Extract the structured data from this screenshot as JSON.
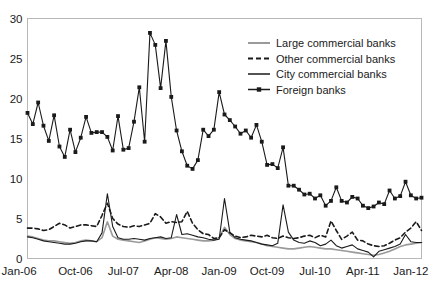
{
  "chart_data": {
    "type": "line",
    "title": "",
    "subtitle": "",
    "xlabel": "",
    "ylabel": "",
    "ylim": [
      0,
      30
    ],
    "yticks": [
      0,
      5,
      10,
      15,
      20,
      25,
      30
    ],
    "ytick_labels": [
      "0",
      "5",
      "10",
      "15",
      "20",
      "25",
      "30"
    ],
    "grid": false,
    "legend_position": "top-right",
    "x_start": "Jan-06",
    "x_end": "Mar-12",
    "x_interval": "monthly",
    "xtick_labels": [
      "Jan-06",
      "Oct-06",
      "Jul-07",
      "Apr-08",
      "Jan-09",
      "Oct-09",
      "Jul-10",
      "Apr-11",
      "Jan-12"
    ],
    "xtick_indices": [
      0,
      9,
      18,
      27,
      36,
      45,
      54,
      63,
      72
    ],
    "x": [
      "Jan-06",
      "Feb-06",
      "Mar-06",
      "Apr-06",
      "May-06",
      "Jun-06",
      "Jul-06",
      "Aug-06",
      "Sep-06",
      "Oct-06",
      "Nov-06",
      "Dec-06",
      "Jan-07",
      "Feb-07",
      "Mar-07",
      "Apr-07",
      "May-07",
      "Jun-07",
      "Jul-07",
      "Aug-07",
      "Sep-07",
      "Oct-07",
      "Nov-07",
      "Dec-07",
      "Jan-08",
      "Feb-08",
      "Mar-08",
      "Apr-08",
      "May-08",
      "Jun-08",
      "Jul-08",
      "Aug-08",
      "Sep-08",
      "Oct-08",
      "Nov-08",
      "Dec-08",
      "Jan-09",
      "Feb-09",
      "Mar-09",
      "Apr-09",
      "May-09",
      "Jun-09",
      "Jul-09",
      "Aug-09",
      "Sep-09",
      "Oct-09",
      "Nov-09",
      "Dec-09",
      "Jan-10",
      "Feb-10",
      "Mar-10",
      "Apr-10",
      "May-10",
      "Jun-10",
      "Jul-10",
      "Aug-10",
      "Sep-10",
      "Oct-10",
      "Nov-10",
      "Dec-10",
      "Jan-11",
      "Feb-11",
      "Mar-11",
      "Apr-11",
      "May-11",
      "Jun-11",
      "Jul-11",
      "Aug-11",
      "Sep-11",
      "Oct-11",
      "Nov-11",
      "Dec-11",
      "Jan-12",
      "Feb-12",
      "Mar-12"
    ],
    "series": [
      {
        "name": "Large commercial banks",
        "style": "solid",
        "color": "#9a9a9a",
        "width": 1.6,
        "marker": "none",
        "values": [
          2.8,
          2.7,
          2.5,
          2.3,
          2.2,
          2.2,
          2.1,
          2.0,
          1.9,
          2.0,
          2.2,
          2.3,
          2.2,
          2.1,
          2.6,
          4.6,
          2.8,
          2.4,
          2.3,
          2.2,
          2.1,
          2.0,
          2.2,
          2.4,
          2.6,
          2.5,
          2.4,
          2.5,
          2.7,
          2.6,
          2.5,
          2.4,
          2.3,
          2.2,
          2.2,
          2.3,
          2.6,
          3.9,
          3.0,
          2.5,
          2.3,
          2.2,
          2.1,
          2.0,
          1.8,
          1.6,
          1.5,
          1.4,
          1.3,
          1.2,
          1.2,
          1.3,
          1.4,
          1.5,
          1.4,
          1.3,
          1.2,
          1.2,
          1.1,
          1.0,
          0.9,
          0.8,
          0.7,
          0.6,
          0.5,
          0.4,
          0.5,
          0.7,
          0.9,
          1.2,
          1.5,
          1.7,
          1.8,
          1.9,
          2.0
        ]
      },
      {
        "name": "Other commercial banks",
        "style": "dashed",
        "color": "#1a1a1a",
        "width": 1.6,
        "marker": "none",
        "values": [
          3.8,
          3.8,
          3.7,
          3.5,
          3.6,
          4.0,
          4.4,
          4.2,
          3.8,
          4.0,
          4.2,
          4.2,
          4.1,
          4.0,
          5.4,
          6.9,
          5.0,
          4.3,
          4.0,
          3.9,
          4.1,
          4.0,
          4.2,
          4.4,
          5.6,
          5.2,
          4.4,
          4.6,
          4.5,
          4.6,
          5.9,
          4.4,
          3.6,
          3.1,
          3.0,
          2.5,
          2.6,
          3.6,
          3.2,
          2.8,
          2.6,
          2.7,
          2.9,
          2.8,
          2.7,
          2.9,
          2.6,
          2.5,
          2.8,
          2.6,
          2.5,
          2.6,
          2.8,
          2.9,
          2.6,
          2.9,
          2.7,
          4.7,
          3.5,
          2.4,
          2.8,
          3.3,
          2.3,
          2.2,
          1.8,
          1.6,
          1.5,
          1.6,
          1.9,
          2.3,
          2.6,
          3.3,
          3.8,
          4.6,
          3.5
        ]
      },
      {
        "name": "City commercial banks",
        "style": "solid",
        "color": "#1a1a1a",
        "width": 1.1,
        "marker": "none",
        "values": [
          2.7,
          2.6,
          2.4,
          2.2,
          2.1,
          2.0,
          1.9,
          1.8,
          1.8,
          1.9,
          2.1,
          2.2,
          2.2,
          2.1,
          3.2,
          8.1,
          4.0,
          2.6,
          2.4,
          2.4,
          2.5,
          2.4,
          2.3,
          2.5,
          2.6,
          2.7,
          2.5,
          2.6,
          5.5,
          3.0,
          3.1,
          2.9,
          2.7,
          2.6,
          2.4,
          2.3,
          2.4,
          7.5,
          3.3,
          2.6,
          2.4,
          2.3,
          2.2,
          2.0,
          1.8,
          1.7,
          1.6,
          1.9,
          6.7,
          3.3,
          2.3,
          2.0,
          1.9,
          2.2,
          2.0,
          1.6,
          1.8,
          2.3,
          1.6,
          1.3,
          1.5,
          1.7,
          1.2,
          1.0,
          0.8,
          0.2,
          0.9,
          1.1,
          1.3,
          1.5,
          1.8,
          3.0,
          2.1,
          2.0,
          2.0
        ]
      },
      {
        "name": "Foreign banks",
        "style": "solid",
        "color": "#1a1a1a",
        "width": 1.1,
        "marker": "square",
        "values": [
          18.2,
          16.8,
          19.5,
          16.6,
          14.7,
          17.9,
          14.0,
          12.7,
          16.1,
          13.3,
          15.1,
          17.7,
          15.7,
          15.8,
          15.8,
          15.2,
          13.5,
          17.8,
          13.6,
          13.8,
          17.1,
          21.4,
          14.6,
          28.2,
          26.7,
          21.3,
          27.2,
          20.2,
          16.0,
          13.4,
          11.6,
          11.2,
          12.3,
          16.1,
          15.3,
          16.1,
          20.8,
          18.0,
          17.3,
          16.5,
          15.6,
          16.0,
          15.1,
          16.7,
          14.6,
          11.7,
          11.8,
          11.3,
          13.9,
          9.1,
          9.1,
          8.6,
          8.0,
          8.1,
          7.5,
          7.9,
          6.6,
          7.2,
          8.9,
          7.2,
          7.0,
          7.7,
          7.5,
          6.6,
          6.3,
          6.5,
          7.0,
          6.8,
          8.5,
          7.5,
          7.8,
          9.6,
          7.9,
          7.5,
          7.6
        ]
      }
    ]
  },
  "legend": {
    "items": [
      {
        "label": "Large commercial banks",
        "key": "solid-gray"
      },
      {
        "label": "Other commercial banks",
        "key": "dashed-black"
      },
      {
        "label": "City commercial banks",
        "key": "solid-black-thin"
      },
      {
        "label": "Foreign banks",
        "key": "solid-black-square-marker"
      }
    ]
  },
  "colors": {
    "gray_series": "#9a9a9a",
    "black_series": "#1a1a1a",
    "frame": "#b8b8b8",
    "background": "#ffffff"
  }
}
